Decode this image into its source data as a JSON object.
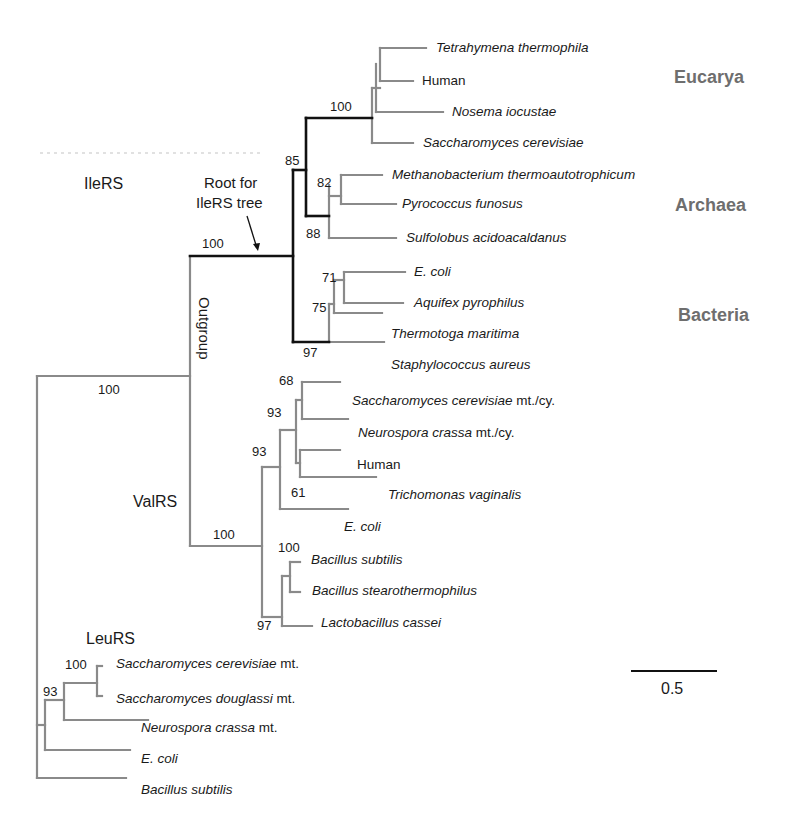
{
  "figure": {
    "groups": {
      "ileRS": "IleRS",
      "valRS": "ValRS",
      "leuRS": "LeuRS",
      "outgroup": "Outgroup",
      "root_note_line1": "Root for",
      "root_note_line2": "IleRS tree"
    },
    "domains": {
      "eucarya": "Eucarya",
      "archaea": "Archaea",
      "bacteria": "Bacteria"
    },
    "scale_bar": {
      "label": "0.5"
    },
    "colors": {
      "ileRS_backbone": "#111111",
      "branch": "#8a8a8a",
      "domain_label": "#6e6e6e"
    },
    "taxa": {
      "ile": [
        {
          "name": "Tetrahymena thermophila",
          "suffix": ""
        },
        {
          "name": "",
          "suffix": "Human"
        },
        {
          "name": "Nosema iocustae",
          "suffix": ""
        },
        {
          "name": "Saccharomyces cerevisiae",
          "suffix": ""
        },
        {
          "name": "Methanobacterium thermoautotrophicum",
          "suffix": ""
        },
        {
          "name": "Pyrococcus funosus",
          "suffix": ""
        },
        {
          "name": "Sulfolobus acidoacaldanus",
          "suffix": ""
        },
        {
          "name": "E. coli",
          "suffix": ""
        },
        {
          "name": "Aquifex pyrophilus",
          "suffix": ""
        },
        {
          "name": "Thermotoga maritima",
          "suffix": ""
        },
        {
          "name": "Staphylococcus aureus",
          "suffix": ""
        }
      ],
      "val": [
        {
          "name": "Saccharomyces cerevisiae",
          "suffix": " mt./cy."
        },
        {
          "name": "Neurospora crassa",
          "suffix": " mt./cy."
        },
        {
          "name": "",
          "suffix": "Human"
        },
        {
          "name": "Trichomonas vaginalis",
          "suffix": ""
        },
        {
          "name": "E. coli",
          "suffix": ""
        },
        {
          "name": "Bacillus subtilis",
          "suffix": ""
        },
        {
          "name": "Bacillus stearothermophilus",
          "suffix": ""
        },
        {
          "name": "Lactobacillus cassei",
          "suffix": ""
        }
      ],
      "leu": [
        {
          "name": "Saccharomyces cerevisiae",
          "suffix": " mt."
        },
        {
          "name": "Saccharomyces douglassi",
          "suffix": " mt."
        },
        {
          "name": "Neurospora crassa",
          "suffix": " mt."
        },
        {
          "name": "E. coli",
          "suffix": ""
        },
        {
          "name": "Bacillus subtilis",
          "suffix": ""
        }
      ]
    },
    "bootstrap": {
      "eucarya": "100",
      "ile_85": "85",
      "archaea_82": "82",
      "archaea_88": "88",
      "bact_71": "71",
      "bact_75": "75",
      "bact_97": "97",
      "ile_root": "100",
      "ile_val": "100",
      "val_root": "100",
      "val_93a": "93",
      "val_93b": "93",
      "val_68": "68",
      "val_61": "61",
      "val_100": "100",
      "val_97": "97",
      "leu_100": "100",
      "leu_93": "93"
    }
  }
}
